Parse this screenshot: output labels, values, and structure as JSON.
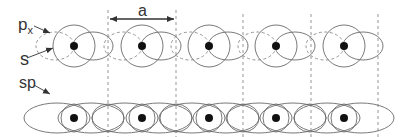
{
  "labels": {
    "px": "p",
    "px_sub": "x",
    "s": "s",
    "sp": "sp",
    "a": "a"
  },
  "colors": {
    "stroke": "#6a6a6a",
    "dashed": "#8a8a8a",
    "dot": "#111111",
    "text": "#333333"
  },
  "top_row": {
    "y": 46,
    "atoms_x": [
      74,
      142,
      209,
      276,
      344
    ],
    "cell_boundaries_x": [
      108,
      176,
      243,
      311,
      378
    ],
    "circle_r": 21,
    "px_solid_lobe": {
      "dx": 19,
      "rx": 20,
      "ry": 14
    },
    "px_dashed_lobe": {
      "dx": -19,
      "rx": 19,
      "ry": 14
    }
  },
  "bottom_row": {
    "y": 118,
    "atoms_x": [
      74,
      142,
      209,
      276,
      344
    ],
    "small_ellipse": {
      "rx": 14,
      "ry": 14
    },
    "big_ellipse": {
      "rx": 33,
      "ry": 15
    }
  },
  "lattice_constant_arrow": {
    "x1": 108,
    "x2": 176,
    "y": 19
  }
}
